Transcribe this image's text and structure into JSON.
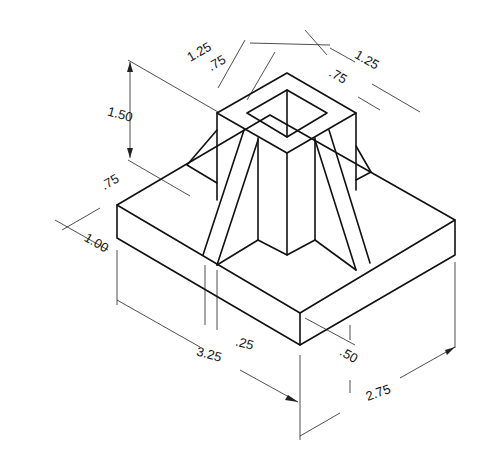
{
  "dimensions": {
    "top_outer_left": "1.25",
    "top_inner_left": ".75",
    "top_outer_right": "1.25",
    "top_inner_right": ".75",
    "tower_height": "1.50",
    "rib_offset": ".75",
    "base_height_left": "1.00",
    "base_length": "3.25",
    "rib_thickness": ".25",
    "base_thickness": ".50",
    "base_width": "2.75"
  }
}
